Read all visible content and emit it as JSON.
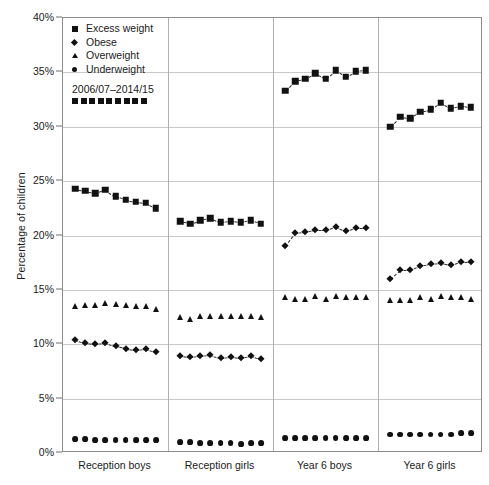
{
  "chart_data": {
    "type": "scatter",
    "title": "",
    "xlabel": "",
    "ylabel": "Percentage of children",
    "ylim": [
      0,
      40
    ],
    "ytick_values": [
      0,
      5,
      10,
      15,
      20,
      25,
      30,
      35,
      40
    ],
    "ytick_labels": [
      "0%",
      "5%",
      "10%",
      "15%",
      "20%",
      "25%",
      "30%",
      "35%",
      "40%"
    ],
    "grid": true,
    "legend_position": "top-left",
    "period_label": "2006/07–2014/15",
    "years": [
      "2006/07",
      "2007/08",
      "2008/09",
      "2009/10",
      "2010/11",
      "2011/12",
      "2012/13",
      "2013/14",
      "2014/15"
    ],
    "categories": [
      "Reception boys",
      "Reception girls",
      "Year 6 boys",
      "Year 6 girls"
    ],
    "legend_entries": [
      {
        "label": "Excess weight",
        "marker": "square"
      },
      {
        "label": "Obese",
        "marker": "diamond"
      },
      {
        "label": "Overweight",
        "marker": "triangle"
      },
      {
        "label": "Underweight",
        "marker": "circle"
      }
    ],
    "panels": [
      {
        "name": "Reception boys",
        "series": [
          {
            "name": "Excess weight",
            "marker": "square",
            "values": [
              24.3,
              24.1,
              23.9,
              24.2,
              23.6,
              23.3,
              23.1,
              23.0,
              22.5
            ]
          },
          {
            "name": "Obese",
            "marker": "diamond",
            "values": [
              10.4,
              10.1,
              10.0,
              10.1,
              9.8,
              9.6,
              9.5,
              9.6,
              9.3
            ]
          },
          {
            "name": "Overweight",
            "marker": "triangle",
            "values": [
              13.5,
              13.6,
              13.6,
              13.8,
              13.7,
              13.6,
              13.5,
              13.5,
              13.2
            ]
          },
          {
            "name": "Underweight",
            "marker": "circle",
            "values": [
              1.3,
              1.3,
              1.2,
              1.2,
              1.2,
              1.2,
              1.2,
              1.2,
              1.2
            ]
          }
        ]
      },
      {
        "name": "Reception girls",
        "series": [
          {
            "name": "Excess weight",
            "marker": "square",
            "values": [
              21.3,
              21.1,
              21.4,
              21.6,
              21.2,
              21.3,
              21.2,
              21.4,
              21.1
            ]
          },
          {
            "name": "Obese",
            "marker": "diamond",
            "values": [
              8.9,
              8.8,
              8.9,
              9.0,
              8.7,
              8.8,
              8.7,
              8.9,
              8.6
            ]
          },
          {
            "name": "Overweight",
            "marker": "triangle",
            "values": [
              12.5,
              12.3,
              12.6,
              12.6,
              12.6,
              12.6,
              12.6,
              12.6,
              12.5
            ]
          },
          {
            "name": "Underweight",
            "marker": "circle",
            "values": [
              1.0,
              1.0,
              0.9,
              0.9,
              0.9,
              0.9,
              0.8,
              0.9,
              0.9
            ]
          }
        ]
      },
      {
        "name": "Year 6 boys",
        "series": [
          {
            "name": "Excess weight",
            "marker": "square",
            "values": [
              33.3,
              34.2,
              34.4,
              34.9,
              34.4,
              35.2,
              34.6,
              35.1,
              35.2
            ]
          },
          {
            "name": "Obese",
            "marker": "diamond",
            "values": [
              19.0,
              20.2,
              20.3,
              20.5,
              20.5,
              20.8,
              20.4,
              20.7,
              20.7
            ]
          },
          {
            "name": "Overweight",
            "marker": "triangle",
            "values": [
              14.3,
              14.2,
              14.2,
              14.4,
              14.2,
              14.4,
              14.3,
              14.3,
              14.3
            ]
          },
          {
            "name": "Underweight",
            "marker": "circle",
            "values": [
              1.4,
              1.4,
              1.4,
              1.4,
              1.4,
              1.4,
              1.4,
              1.4,
              1.4
            ]
          }
        ]
      },
      {
        "name": "Year 6 girls",
        "series": [
          {
            "name": "Excess weight",
            "marker": "square",
            "values": [
              30.0,
              30.9,
              30.8,
              31.4,
              31.6,
              32.2,
              31.7,
              31.9,
              31.8
            ]
          },
          {
            "name": "Obese",
            "marker": "diamond",
            "values": [
              16.0,
              16.8,
              16.8,
              17.2,
              17.4,
              17.5,
              17.3,
              17.6,
              17.6
            ]
          },
          {
            "name": "Overweight",
            "marker": "triangle",
            "values": [
              14.1,
              14.1,
              14.1,
              14.3,
              14.2,
              14.4,
              14.3,
              14.3,
              14.2
            ]
          },
          {
            "name": "Underweight",
            "marker": "circle",
            "values": [
              1.7,
              1.7,
              1.7,
              1.7,
              1.7,
              1.7,
              1.7,
              1.8,
              1.8
            ]
          }
        ]
      }
    ],
    "trend_series": [
      "Excess weight",
      "Obese"
    ]
  },
  "colors": {
    "marker": "#111111",
    "gridline": "#c9c9c9",
    "frame": "#8c8c8c",
    "text": "#1a1a1a",
    "background": "#ffffff"
  }
}
